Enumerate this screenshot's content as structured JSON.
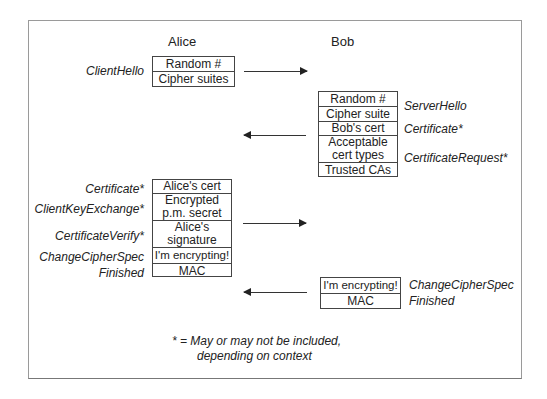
{
  "headers": {
    "alice": "Alice",
    "bob": "Bob"
  },
  "client_hello": {
    "label": "ClientHello",
    "cells": [
      "Random #",
      "Cipher suites"
    ]
  },
  "server_msgs": {
    "cells": [
      "Random #",
      "Cipher suite",
      "Bob's cert",
      "Acceptable cert types",
      "Trusted CAs"
    ],
    "labels": [
      "ServerHello",
      "Certificate*",
      "CertificateRequest*"
    ]
  },
  "client_msgs": {
    "cells": [
      "Alice's cert",
      "Encrypted p.m. secret",
      "Alice's signature",
      "I'm encrypting!",
      "MAC"
    ],
    "labels": [
      "Certificate*",
      "ClientKeyExchange*",
      "CertificateVerify*",
      "ChangeCipherSpec",
      "Finished"
    ]
  },
  "server_finish": {
    "cells": [
      "I'm encrypting!",
      "MAC"
    ],
    "labels": [
      "ChangeCipherSpec",
      "Finished"
    ]
  },
  "footnote": {
    "line1": "* = May or may not be included,",
    "line2": "depending on context"
  }
}
